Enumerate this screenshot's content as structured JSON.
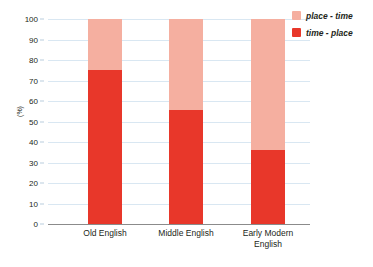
{
  "chart_data": {
    "type": "bar",
    "subtype": "stacked-bar-100",
    "title": "",
    "xlabel": "",
    "ylabel": "(%)",
    "ylim": [
      0,
      100
    ],
    "ytick_step": 10,
    "yticks": [
      "100",
      "90",
      "80",
      "70",
      "60",
      "50",
      "40",
      "30",
      "20",
      "10",
      "0"
    ],
    "ytick_values": [
      100,
      90,
      80,
      70,
      60,
      50,
      40,
      30,
      20,
      10,
      0
    ],
    "grid": true,
    "grid_color": "#d9e7f2",
    "legend_position": "top-right",
    "categories": [
      "Old English",
      "Middle English",
      "Early Modern English"
    ],
    "series": [
      {
        "name": "time - place",
        "color": "#e8372a",
        "values": [
          75,
          55.5,
          36
        ]
      },
      {
        "name": "place - time",
        "color": "#f5afa0",
        "values": [
          25,
          44.5,
          64
        ]
      }
    ]
  },
  "legend": {
    "items": [
      {
        "label": "place - time",
        "color": "#f5afa0"
      },
      {
        "label": "time - place",
        "color": "#e8372a"
      }
    ]
  },
  "axes": {
    "y_title": "(%)"
  }
}
